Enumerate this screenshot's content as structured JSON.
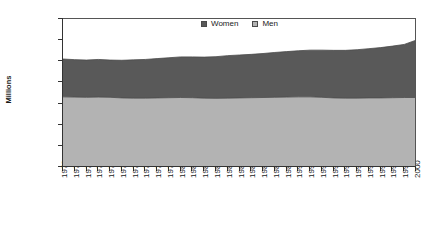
{
  "chart_data": {
    "type": "area",
    "stacked": true,
    "title": "",
    "subtitle": "",
    "xlabel": "",
    "ylabel": "Millions",
    "grid": false,
    "legend_position": "top-center-inside",
    "ylim": [
      0,
      35
    ],
    "ytick_labels": [
      "0.000",
      "5.000",
      "10.000",
      "15.000",
      "20.000",
      "25.000",
      "30.000",
      "35.000"
    ],
    "ytick_values": [
      0,
      5,
      10,
      15,
      20,
      25,
      30,
      35
    ],
    "categories": [
      "1970",
      "1971",
      "1972",
      "1973",
      "1974",
      "1975",
      "1976",
      "1977",
      "1978",
      "1979",
      "1980",
      "1981",
      "1982",
      "1983",
      "1984",
      "1985",
      "1986",
      "1987",
      "1988",
      "1989",
      "1990",
      "1991",
      "1992",
      "1993",
      "1994",
      "1995",
      "1996",
      "1997",
      "1998",
      "1999",
      "2000"
    ],
    "series": [
      {
        "name": "Men",
        "color": "#b3b3b3",
        "values": [
          16.35,
          16.3,
          16.25,
          16.3,
          16.25,
          16.1,
          16.05,
          16.05,
          16.1,
          16.15,
          16.2,
          16.15,
          16.05,
          16.0,
          16.05,
          16.1,
          16.15,
          16.2,
          16.25,
          16.3,
          16.35,
          16.35,
          16.25,
          16.1,
          16.05,
          16.05,
          16.1,
          16.1,
          16.15,
          16.2,
          16.2
        ]
      },
      {
        "name": "Women",
        "color": "#595959",
        "values": [
          8.95,
          8.85,
          8.8,
          8.9,
          8.8,
          8.9,
          9.05,
          9.15,
          9.3,
          9.45,
          9.6,
          9.65,
          9.7,
          9.85,
          10.05,
          10.15,
          10.25,
          10.4,
          10.6,
          10.75,
          10.9,
          11.05,
          11.15,
          11.25,
          11.3,
          11.45,
          11.65,
          11.9,
          12.2,
          12.55,
          13.55
        ]
      }
    ],
    "totals": [
      25.3,
      25.15,
      25.05,
      25.2,
      25.05,
      25.0,
      25.1,
      25.2,
      25.4,
      25.6,
      25.8,
      25.8,
      25.75,
      25.85,
      26.1,
      26.25,
      26.4,
      26.6,
      26.85,
      27.05,
      27.25,
      27.4,
      27.4,
      27.35,
      27.35,
      27.5,
      27.75,
      28.0,
      28.35,
      28.75,
      29.75
    ]
  },
  "legend": {
    "entries": [
      {
        "label": "Women",
        "swatch_icon": "legend-swatch-dark"
      },
      {
        "label": "Men",
        "swatch_icon": "legend-swatch-light"
      }
    ]
  },
  "caption": {
    "text": ""
  }
}
